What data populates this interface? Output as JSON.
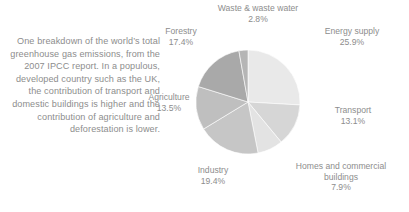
{
  "caption": {
    "text": "One breakdown of the world’s total greenhouse gas emissions, from the 2007 IPCC report. In a populous, developed country such as the UK, the contribution of transport and domestic buildings is higher and the contribution of agriculture and deforestation is lower."
  },
  "chart_data": {
    "type": "pie",
    "title": "",
    "legend_position": "around-slices",
    "start_angle_deg": 0,
    "direction": "clockwise",
    "categories": [
      "Energy supply",
      "Transport",
      "Homes and commercial buildings",
      "Industry",
      "Agriculture",
      "Forestry",
      "Waste & waste water"
    ],
    "values": [
      25.9,
      13.1,
      7.9,
      19.4,
      13.5,
      17.4,
      2.8
    ],
    "unit": "%",
    "colors": [
      "#e9e9e9",
      "#d6d6d6",
      "#e3e3e3",
      "#c6c6c6",
      "#bfbfbf",
      "#a9a9a9",
      "#b5b5b5"
    ],
    "slices": [
      {
        "label": "Energy supply",
        "value": 25.9,
        "value_text": "25.9%",
        "color": "#e9e9e9"
      },
      {
        "label": "Transport",
        "value": 13.1,
        "value_text": "13.1%",
        "color": "#d6d6d6"
      },
      {
        "label": "Homes and commercial buildings",
        "value": 7.9,
        "value_text": "7.9%",
        "color": "#e3e3e3"
      },
      {
        "label": "Industry",
        "value": 19.4,
        "value_text": "19.4%",
        "color": "#c6c6c6"
      },
      {
        "label": "Agriculture",
        "value": 13.5,
        "value_text": "13.5%",
        "color": "#bfbfbf"
      },
      {
        "label": "Forestry",
        "value": 17.4,
        "value_text": "17.4%",
        "color": "#a9a9a9"
      },
      {
        "label": "Waste & waste water",
        "value": 2.8,
        "value_text": "2.8%",
        "color": "#b5b5b5"
      }
    ]
  },
  "labels": {
    "waste": {
      "name": "Waste & waste water",
      "pct": "2.8%"
    },
    "energy": {
      "name": "Energy supply",
      "pct": "25.9%"
    },
    "transport": {
      "name": "Transport",
      "pct": "13.1%"
    },
    "homes": {
      "name": "Homes and commercial buildings",
      "pct": "7.9%"
    },
    "industry": {
      "name": "Industry",
      "pct": "19.4%"
    },
    "agri": {
      "name": "Agriculture",
      "pct": "13.5%"
    },
    "forestry": {
      "name": "Forestry",
      "pct": "17.4%"
    }
  }
}
